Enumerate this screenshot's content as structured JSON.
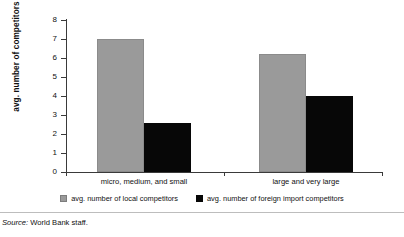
{
  "chart_data": {
    "type": "bar",
    "title": "",
    "xlabel": "",
    "ylabel": "avg. number of competitors",
    "ylim": [
      0,
      8
    ],
    "yticks": [
      "0",
      "1",
      "2",
      "3",
      "4",
      "5",
      "6",
      "7",
      "8"
    ],
    "grid": false,
    "legend_position": "bottom",
    "categories": [
      "micro, medium, and small",
      "large and very large"
    ],
    "series": [
      {
        "name": "avg. number of local competitors",
        "color": "#9a9a9a",
        "values": [
          7.0,
          6.2
        ]
      },
      {
        "name": "avg. number of foreign import competitors",
        "color": "#070707",
        "values": [
          2.6,
          4.0
        ]
      }
    ]
  },
  "source": {
    "keyword": "Source:",
    "text": "World Bank staff."
  }
}
